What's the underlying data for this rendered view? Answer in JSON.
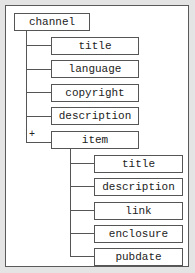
{
  "diagram": {
    "type": "tree",
    "root": {
      "label": "channel",
      "children": [
        {
          "label": "title"
        },
        {
          "label": "language"
        },
        {
          "label": "copyright"
        },
        {
          "label": "description"
        },
        {
          "label": "item",
          "multiplicity": "+",
          "children": [
            {
              "label": "title"
            },
            {
              "label": "description"
            },
            {
              "label": "link"
            },
            {
              "label": "enclosure"
            },
            {
              "label": "pubdate"
            }
          ]
        }
      ]
    }
  },
  "colors": {
    "background": "#e4e4e4",
    "frame": "#ffffff",
    "border": "#555555",
    "text": "#222222"
  }
}
